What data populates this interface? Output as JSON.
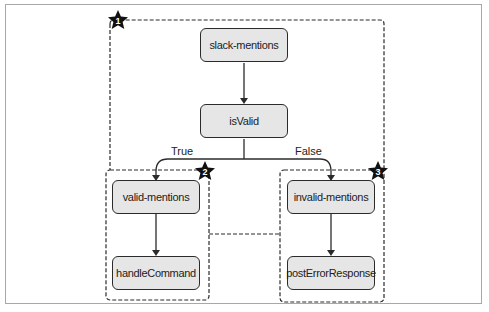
{
  "diagram": {
    "nodes": {
      "slack_mentions": "slack-mentions",
      "is_valid": "isValid",
      "valid_mentions": "valid-mentions",
      "handle_command": "handleCommand",
      "invalid_mentions": "invalid-mentions",
      "post_error_response": "postErrorResponse"
    },
    "edge_labels": {
      "true": "True",
      "false": "False"
    },
    "badges": {
      "group1": "1",
      "group2": "2",
      "group3": "3"
    },
    "edges": [
      {
        "from": "slack-mentions",
        "to": "isValid"
      },
      {
        "from": "isValid",
        "to": "valid-mentions",
        "label": "True"
      },
      {
        "from": "isValid",
        "to": "invalid-mentions",
        "label": "False"
      },
      {
        "from": "valid-mentions",
        "to": "handleCommand"
      },
      {
        "from": "invalid-mentions",
        "to": "postErrorResponse"
      }
    ],
    "colors": {
      "node_fill": "#e6e6e6",
      "stroke": "#2b2b2b",
      "frame_border": "#a8a8a8"
    }
  }
}
